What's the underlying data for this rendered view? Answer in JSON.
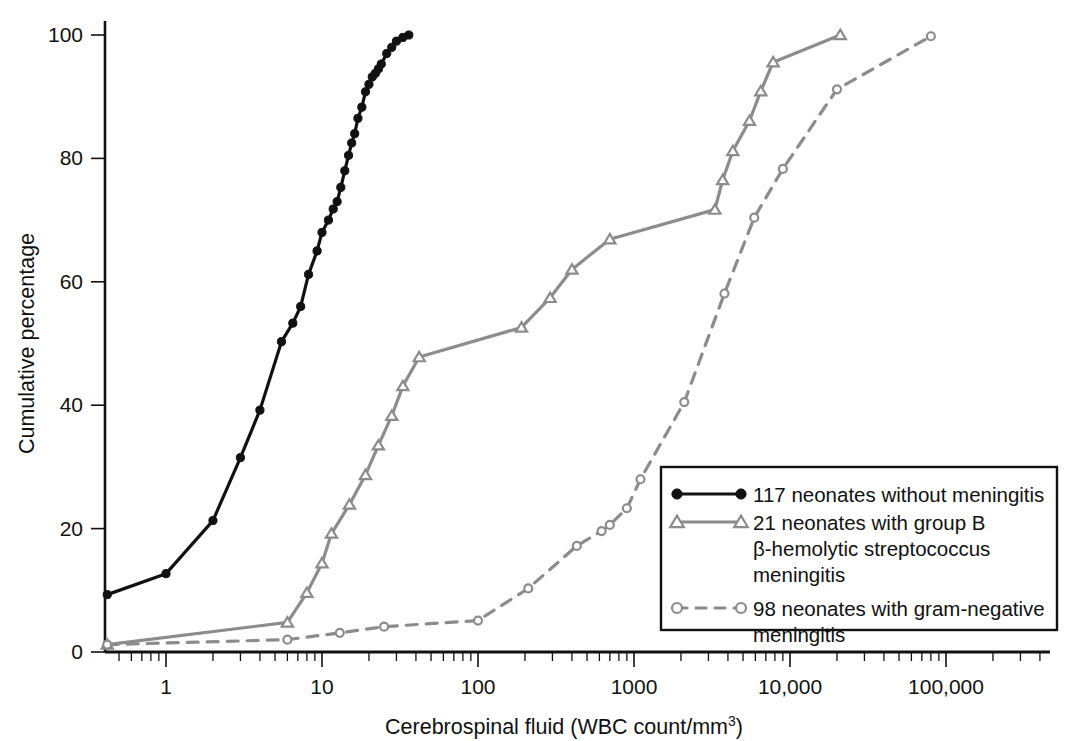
{
  "chart_data": {
    "type": "line",
    "title": "",
    "xlabel": "Cerebrospinal fluid (WBC count/mm",
    "xlabel_sup": "3",
    "xlabel_tail": ")",
    "ylabel": "Cumulative percentage",
    "x_scale": "log",
    "xlim": [
      0.38,
      170000
    ],
    "ylim": [
      0,
      101
    ],
    "grid": false,
    "legend_position": "bottom-right",
    "x_ticks": [
      {
        "value": 1,
        "label": "1"
      },
      {
        "value": 10,
        "label": "10"
      },
      {
        "value": 100,
        "label": "100"
      },
      {
        "value": 1000,
        "label": "1000"
      },
      {
        "value": 10000,
        "label": "10,000"
      },
      {
        "value": 100000,
        "label": "100,000"
      }
    ],
    "y_ticks": [
      {
        "value": 0,
        "label": "0"
      },
      {
        "value": 20,
        "label": "20"
      },
      {
        "value": 40,
        "label": "40"
      },
      {
        "value": 60,
        "label": "60"
      },
      {
        "value": 80,
        "label": "80"
      },
      {
        "value": 100,
        "label": "100"
      }
    ],
    "series": [
      {
        "name": "117 neonates without meningitis",
        "legend_label": "117 neonates without meningitis",
        "marker": "filled-circle",
        "color": "#111111",
        "line_style": "solid",
        "line_width": 3.2,
        "marker_size": 8.2,
        "points": [
          [
            0.42,
            9.3
          ],
          [
            1.0,
            12.7
          ],
          [
            2.0,
            21.3
          ],
          [
            3.0,
            31.5
          ],
          [
            4.0,
            39.2
          ],
          [
            5.5,
            50.3
          ],
          [
            6.5,
            53.3
          ],
          [
            7.3,
            56.0
          ],
          [
            8.2,
            61.2
          ],
          [
            9.3,
            65.0
          ],
          [
            10.0,
            68.0
          ],
          [
            11.0,
            70.0
          ],
          [
            11.8,
            71.8
          ],
          [
            12.5,
            73.0
          ],
          [
            13.2,
            75.3
          ],
          [
            14.0,
            78.0
          ],
          [
            14.8,
            80.5
          ],
          [
            15.5,
            82.5
          ],
          [
            16.2,
            84.0
          ],
          [
            17.0,
            86.5
          ],
          [
            18.0,
            88.3
          ],
          [
            19.0,
            90.8
          ],
          [
            20.0,
            92.0
          ],
          [
            21.0,
            93.2
          ],
          [
            22.0,
            93.8
          ],
          [
            23.0,
            94.5
          ],
          [
            24.0,
            95.3
          ],
          [
            26.0,
            97.0
          ],
          [
            28.0,
            98.0
          ],
          [
            30.0,
            99.0
          ],
          [
            33.0,
            99.6
          ],
          [
            36.0,
            100.0
          ]
        ]
      },
      {
        "name": "21 neonates with group B beta-hemolytic streptococcus meningitis",
        "legend_label_line1": "21 neonates with group B",
        "legend_label_line2": "β-hemolytic streptococcus",
        "legend_label_line3": "meningitis",
        "marker": "open-triangle",
        "color": "#8c8c8c",
        "line_style": "solid",
        "line_width": 3.2,
        "marker_size": 9.5,
        "points": [
          [
            0.42,
            1.2
          ],
          [
            6.0,
            4.8
          ],
          [
            8.0,
            9.6
          ],
          [
            10.0,
            14.4
          ],
          [
            11.5,
            19.2
          ],
          [
            15.0,
            23.9
          ],
          [
            19.0,
            28.7
          ],
          [
            23.0,
            33.5
          ],
          [
            28.0,
            38.3
          ],
          [
            33.0,
            43.1
          ],
          [
            42.0,
            47.8
          ],
          [
            190.0,
            52.6
          ],
          [
            290.0,
            57.4
          ],
          [
            400.0,
            62.0
          ],
          [
            700.0,
            66.9
          ],
          [
            3300.0,
            71.7
          ],
          [
            3700.0,
            76.5
          ],
          [
            4300.0,
            81.2
          ],
          [
            5500.0,
            86.1
          ],
          [
            6500.0,
            90.9
          ],
          [
            7800.0,
            95.6
          ],
          [
            21000.0,
            100.0
          ]
        ]
      },
      {
        "name": "98 neonates with gram-negative meningitis",
        "legend_label_line1": "98 neonates with gram-negative",
        "legend_label_line2": "meningitis",
        "marker": "open-circle",
        "color": "#8c8c8c",
        "line_style": "dashed",
        "line_width": 3.2,
        "marker_size": 8.0,
        "points": [
          [
            0.42,
            1.2
          ],
          [
            6.0,
            2.0
          ],
          [
            13.0,
            3.1
          ],
          [
            25.0,
            4.1
          ],
          [
            100.0,
            5.1
          ],
          [
            210.0,
            10.3
          ],
          [
            430.0,
            17.2
          ],
          [
            620.0,
            19.6
          ],
          [
            700.0,
            20.6
          ],
          [
            900.0,
            23.3
          ],
          [
            1100.0,
            28.0
          ],
          [
            2100.0,
            40.5
          ],
          [
            3800.0,
            58.1
          ],
          [
            5900.0,
            70.4
          ],
          [
            9000.0,
            78.3
          ],
          [
            20000.0,
            91.2
          ],
          [
            80000.0,
            99.8
          ]
        ]
      }
    ]
  },
  "legend": {
    "entries": [
      {
        "id": "legend-entry-no-meningitis"
      },
      {
        "id": "legend-entry-group-b"
      },
      {
        "id": "legend-entry-gram-negative"
      }
    ]
  },
  "colors": {
    "axis": "#111111",
    "black_series": "#111111",
    "grey_series": "#8c8c8c",
    "background": "#ffffff"
  }
}
